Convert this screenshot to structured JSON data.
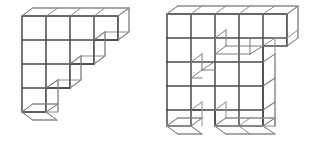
{
  "image": {
    "title": "Two axonometric cube-block polycube figures",
    "width": 322,
    "height": 149,
    "background_color": "#ffffff",
    "line_color_front": "#4a4a4a",
    "line_color_depth": "#8c8c8c",
    "figure_count": 2
  },
  "figures": [
    {
      "id": "left-figure",
      "label": "Left staircase block figure",
      "origin_x": 22,
      "origin_y": 16,
      "cell": 24,
      "depth_dx": 11,
      "depth_dy": -8,
      "grid_cols": 4,
      "grid_rows": 4,
      "filled_cells": [
        [
          0,
          0
        ],
        [
          1,
          0
        ],
        [
          2,
          0
        ],
        [
          3,
          0
        ],
        [
          0,
          1
        ],
        [
          1,
          1
        ],
        [
          2,
          1
        ],
        [
          0,
          2
        ],
        [
          1,
          2
        ],
        [
          0,
          3
        ]
      ],
      "cube_count": 10
    },
    {
      "id": "right-figure",
      "label": "Right notched block figure",
      "origin_x": 167,
      "origin_y": 14,
      "cell": 24,
      "depth_dx": 11,
      "depth_dy": -8,
      "grid_cols": 6,
      "grid_rows": 5,
      "filled_cells": [
        [
          0,
          0
        ],
        [
          1,
          0
        ],
        [
          2,
          0
        ],
        [
          3,
          0
        ],
        [
          4,
          0
        ],
        [
          5,
          0
        ],
        [
          0,
          1
        ],
        [
          1,
          1
        ],
        [
          2,
          1
        ],
        [
          3,
          1
        ],
        [
          4,
          1
        ],
        [
          0,
          2
        ],
        [
          1,
          2
        ],
        [
          2,
          2
        ],
        [
          3,
          2
        ],
        [
          4,
          2
        ],
        [
          0,
          3
        ],
        [
          1,
          3
        ],
        [
          2,
          3
        ],
        [
          3,
          3
        ],
        [
          4,
          3
        ],
        [
          0,
          4
        ],
        [
          2,
          4
        ],
        [
          3,
          4
        ],
        [
          4,
          4
        ]
      ],
      "notches": [
        {
          "col": 2,
          "row": 1,
          "kind": "recessed-step"
        },
        {
          "col": 1,
          "row": 2,
          "kind": "recessed-step"
        }
      ],
      "cube_count": 26
    }
  ]
}
